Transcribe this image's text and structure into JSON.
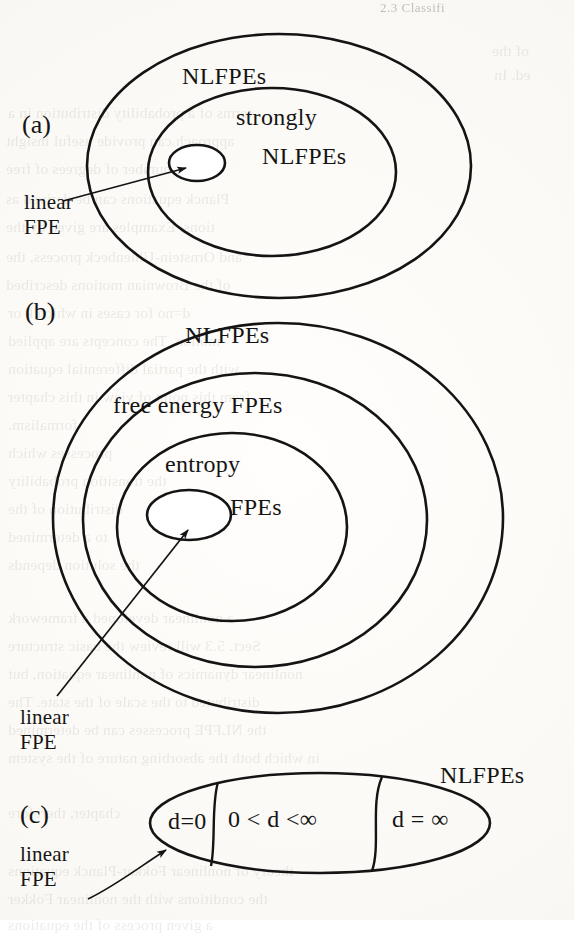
{
  "page": {
    "running_head": "2.3  Classifi",
    "background_color": "#fcfbf9",
    "ink_color": "#141414"
  },
  "figure": {
    "type": "nested-set-venn-diagram",
    "panels": [
      {
        "tag": "(a)",
        "ellipses": [
          {
            "name": "outer",
            "label": "NLFPEs",
            "cx": 279,
            "cy": 166,
            "rx": 192,
            "ry": 132
          },
          {
            "name": "middle",
            "label": "strongly NLFPEs",
            "cx": 272,
            "cy": 172,
            "rx": 124,
            "ry": 84
          },
          {
            "name": "inner",
            "label": "",
            "cx": 197,
            "cy": 163,
            "rx": 28,
            "ry": 18
          }
        ],
        "labels": [
          {
            "text": "NLFPEs",
            "x": 182,
            "y": 63
          },
          {
            "text": "strongly",
            "x": 236,
            "y": 104
          },
          {
            "text": "NLFPEs",
            "x": 262,
            "y": 143
          }
        ],
        "callout": {
          "lines": [
            "linear",
            "FPE"
          ],
          "x": 24,
          "y": 190,
          "arrow_from": [
            63,
            201
          ],
          "arrow_to": [
            184,
            168
          ]
        }
      },
      {
        "tag": "(b)",
        "ellipses": [
          {
            "name": "outer",
            "label": "NLFPEs",
            "cx": 278,
            "cy": 518,
            "rx": 225,
            "ry": 195
          },
          {
            "name": "second",
            "label": "free energy FPEs",
            "cx": 255,
            "cy": 520,
            "rx": 172,
            "ry": 147
          },
          {
            "name": "third",
            "label": "entropy FPEs",
            "cx": 232,
            "cy": 527,
            "rx": 115,
            "ry": 94
          },
          {
            "name": "innermost",
            "label": "",
            "cx": 189,
            "cy": 515,
            "rx": 42,
            "ry": 25
          }
        ],
        "labels": [
          {
            "text": "NLFPEs",
            "x": 185,
            "y": 322
          },
          {
            "text": "free energy FPEs",
            "x": 113,
            "y": 392
          },
          {
            "text": "entropy",
            "x": 165,
            "y": 451
          },
          {
            "text": "FPEs",
            "x": 230,
            "y": 494
          }
        ],
        "callout": {
          "lines": [
            "linear",
            "FPE"
          ],
          "x": 20,
          "y": 705,
          "arrow_from": [
            57,
            696
          ],
          "arrow_to": [
            186,
            528
          ]
        }
      },
      {
        "tag": "(c)",
        "ellipses": [
          {
            "name": "outer",
            "label": "NLFPEs",
            "cx": 320,
            "cy": 823,
            "rx": 170,
            "ry": 50
          }
        ],
        "dividers": [
          {
            "top": [
              218,
              782
            ],
            "bottom": [
              211,
              866
            ]
          },
          {
            "top": [
              382,
              777
            ],
            "bottom": [
              372,
              871
            ]
          }
        ],
        "regions": [
          {
            "text": "d=0",
            "x": 168,
            "y": 810
          },
          {
            "text": "0 < d <∞",
            "x": 228,
            "y": 808
          },
          {
            "text": "d = ∞",
            "x": 392,
            "y": 808
          }
        ],
        "labels": [
          {
            "text": "NLFPEs",
            "x": 440,
            "y": 762
          }
        ],
        "callout": {
          "lines": [
            "linear",
            "FPE"
          ],
          "x": 20,
          "y": 842,
          "arrow_from": [
            88,
            899
          ],
          "arrow_to": [
            167,
            849
          ]
        }
      }
    ]
  },
  "ghost_text": {
    "note": "faint show-through of the printed text on the reverse of the page",
    "lines": [
      {
        "text": "of the",
        "x": 492,
        "y": 38
      },
      {
        "text": "ed. In",
        "x": 494,
        "y": 62
      },
      {
        "text": "terms of a  probability  distribution  in  a",
        "x": 8,
        "y": 100
      },
      {
        "text": "approach  can  provide  useful  insight",
        "x": 6,
        "y": 128
      },
      {
        "text": "a  large  number  of  degrees  of  free",
        "x": 6,
        "y": 156
      },
      {
        "text": "Planck  equations  can  be  derived  as",
        "x": 6,
        "y": 186
      },
      {
        "text": "tions.  Examples  are  given  by  the",
        "x": 6,
        "y": 214
      },
      {
        "text": "and  Ornstein-Uhlenbeck  process,  the",
        "x": 6,
        "y": 244
      },
      {
        "text": "of  the  Brownian  motions  described",
        "x": 6,
        "y": 272
      },
      {
        "text": "d=no  for  cases  in  which  k  or",
        "x": 8,
        "y": 300
      },
      {
        "text": "motion.  The  concepts  are  applied",
        "x": 8,
        "y": 328
      },
      {
        "text": "with  the  partial  differential  equation",
        "x": 8,
        "y": 356
      },
      {
        "text": "from  this  point  of  view  in  this  chapter",
        "x": 8,
        "y": 384
      },
      {
        "text": "formalism.",
        "x": 8,
        "y": 412
      },
      {
        "text": "processes  which",
        "x": 8,
        "y": 440
      },
      {
        "text": "the  transition  probability",
        "x": 8,
        "y": 468
      },
      {
        "text": "distribution  of  the",
        "x": 8,
        "y": 496
      },
      {
        "text": "to  a  determined",
        "x": 8,
        "y": 524
      },
      {
        "text": "the  solution  depends",
        "x": 8,
        "y": 552
      },
      {
        "text": "a  nonlinear  developed  a  framework",
        "x": 8,
        "y": 605
      },
      {
        "text": "Sect. 5.3  will  review  the  basic  structure",
        "x": 8,
        "y": 633
      },
      {
        "text": "nonlinear  dynamics  of  nonlinear  equation,  but",
        "x": 8,
        "y": 661
      },
      {
        "text": "distributed  to  the  scale  of  the  state.  The",
        "x": 8,
        "y": 689
      },
      {
        "text": "the  NLFPE  processes  can  be  determined",
        "x": 8,
        "y": 717
      },
      {
        "text": "in  which  both  the  absorbing  nature  of  the  system",
        "x": 8,
        "y": 745
      },
      {
        "text": "chapter,  therefore",
        "x": 8,
        "y": 800
      },
      {
        "text": "theory  of  nonlinear  Fokker-Planck  equations",
        "x": 8,
        "y": 858
      },
      {
        "text": "the  conditions  with  the  nonlinear  Fokker",
        "x": 8,
        "y": 886
      },
      {
        "text": "a  given  process  of  the  equations",
        "x": 8,
        "y": 912
      }
    ]
  }
}
